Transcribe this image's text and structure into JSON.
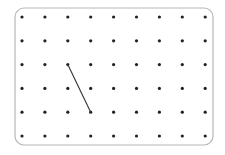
{
  "geoboard": {
    "columns": 9,
    "rows": 6,
    "origin": {
      "x": 22,
      "y": 17
    },
    "spacing": {
      "x": 22.9,
      "y": 23.8
    },
    "dot_color": "#222222",
    "dot_radius": 1.6,
    "frame": {
      "x": 15,
      "y": 8,
      "width": 198,
      "height": 137,
      "radius": 9,
      "stroke": "#b8b8b8"
    },
    "segments": [
      {
        "from": {
          "col": 2,
          "row": 2
        },
        "to": {
          "col": 3,
          "row": 4
        },
        "color": "#333333",
        "width": 1.1
      }
    ]
  }
}
